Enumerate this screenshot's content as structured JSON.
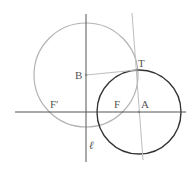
{
  "diagram": {
    "colors": {
      "background": "#ffffff",
      "axis": "#555555",
      "gray_circle": "#b3b3b3",
      "black_circle": "#333333",
      "tangent_line": "#bdbdbd",
      "segment_BT": "#bdbdbd",
      "label": "#555555"
    },
    "lines": {
      "horizontal": {
        "x1": 15,
        "y1": 112,
        "x2": 186,
        "y2": 112
      },
      "vertical_l": {
        "x1": 86,
        "y1": 14,
        "x2": 86,
        "y2": 162
      },
      "tangent": {
        "x1": 132,
        "y1": 13,
        "x2": 143,
        "y2": 160
      },
      "segment_BT": {
        "x1": 86,
        "y1": 75,
        "x2": 137,
        "y2": 70
      }
    },
    "circles": {
      "gray": {
        "cx": 86,
        "cy": 75,
        "r": 52
      },
      "black": {
        "cx": 139,
        "cy": 112,
        "r": 42
      }
    },
    "points": {
      "B": {
        "x": 86,
        "y": 75
      },
      "T": {
        "x": 137,
        "y": 70
      },
      "A": {
        "x": 139,
        "y": 112
      }
    },
    "labels": {
      "B": "B",
      "T": "T",
      "A": "A",
      "F": "F",
      "F_prime": "F′",
      "ell": "ℓ"
    }
  }
}
